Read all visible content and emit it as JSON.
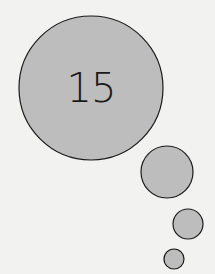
{
  "bubble": {
    "number": "15"
  },
  "colors": {
    "background": "#f2f2f0",
    "fill": "#bdbdbd",
    "stroke": "#1a1a1a"
  }
}
